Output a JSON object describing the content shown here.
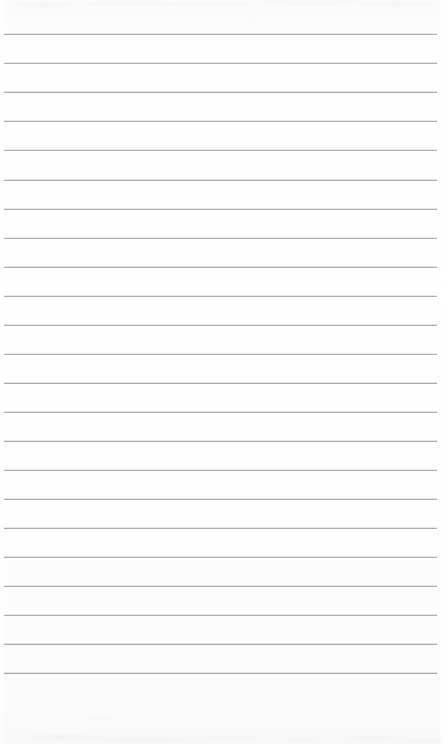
{
  "document": {
    "kind": "scanned-lined-paper",
    "title": "Blank ruled notebook page",
    "page_width": 443,
    "page_height": 744,
    "content_text": "",
    "background_color": "#fdfdfe",
    "rule_color": "#9fa2a9",
    "rule_thickness_px": 1,
    "rule_spacing_px": 30,
    "rule_count": 22,
    "first_rule_y": 34,
    "last_rule_y": 673,
    "rule_left_x": 4,
    "rule_right_x": 437,
    "top_margin_px": 34,
    "bottom_margin_px": 71,
    "left_margin_px": 4,
    "right_margin_px": 6,
    "has_vertical_margin_rule": false,
    "has_handwriting": false,
    "has_printed_text": false
  },
  "rules": [
    {
      "index": 1,
      "y": 34,
      "x1": 4,
      "x2": 437,
      "opacity": 0.88
    },
    {
      "index": 2,
      "y": 63,
      "x1": 4,
      "x2": 437,
      "opacity": 0.84
    },
    {
      "index": 3,
      "y": 92,
      "x1": 4,
      "x2": 437,
      "opacity": 0.9
    },
    {
      "index": 4,
      "y": 121,
      "x1": 4,
      "x2": 437,
      "opacity": 0.86
    },
    {
      "index": 5,
      "y": 150,
      "x1": 4,
      "x2": 437,
      "opacity": 0.82
    },
    {
      "index": 6,
      "y": 180,
      "x1": 4,
      "x2": 437,
      "opacity": 0.9
    },
    {
      "index": 7,
      "y": 209,
      "x1": 4,
      "x2": 437,
      "opacity": 0.87
    },
    {
      "index": 8,
      "y": 238,
      "x1": 4,
      "x2": 437,
      "opacity": 0.83
    },
    {
      "index": 9,
      "y": 267,
      "x1": 4,
      "x2": 437,
      "opacity": 0.89
    },
    {
      "index": 10,
      "y": 296,
      "x1": 4,
      "x2": 437,
      "opacity": 0.85
    },
    {
      "index": 11,
      "y": 325,
      "x1": 4,
      "x2": 437,
      "opacity": 0.88
    },
    {
      "index": 12,
      "y": 354,
      "x1": 4,
      "x2": 437,
      "opacity": 0.84
    },
    {
      "index": 13,
      "y": 383,
      "x1": 4,
      "x2": 437,
      "opacity": 0.9
    },
    {
      "index": 14,
      "y": 412,
      "x1": 4,
      "x2": 437,
      "opacity": 0.86
    },
    {
      "index": 15,
      "y": 441,
      "x1": 4,
      "x2": 437,
      "opacity": 0.88
    },
    {
      "index": 16,
      "y": 470,
      "x1": 4,
      "x2": 437,
      "opacity": 0.85
    },
    {
      "index": 17,
      "y": 499,
      "x1": 4,
      "x2": 437,
      "opacity": 0.9
    },
    {
      "index": 18,
      "y": 528,
      "x1": 4,
      "x2": 437,
      "opacity": 0.87
    },
    {
      "index": 19,
      "y": 557,
      "x1": 4,
      "x2": 437,
      "opacity": 0.84
    },
    {
      "index": 20,
      "y": 586,
      "x1": 4,
      "x2": 437,
      "opacity": 0.89
    },
    {
      "index": 21,
      "y": 615,
      "x1": 4,
      "x2": 437,
      "opacity": 0.86
    },
    {
      "index": 22,
      "y": 644,
      "x1": 4,
      "x2": 437,
      "opacity": 0.92
    },
    {
      "index": 23,
      "y": 673,
      "x1": 4,
      "x2": 437,
      "opacity": 0.94
    }
  ]
}
